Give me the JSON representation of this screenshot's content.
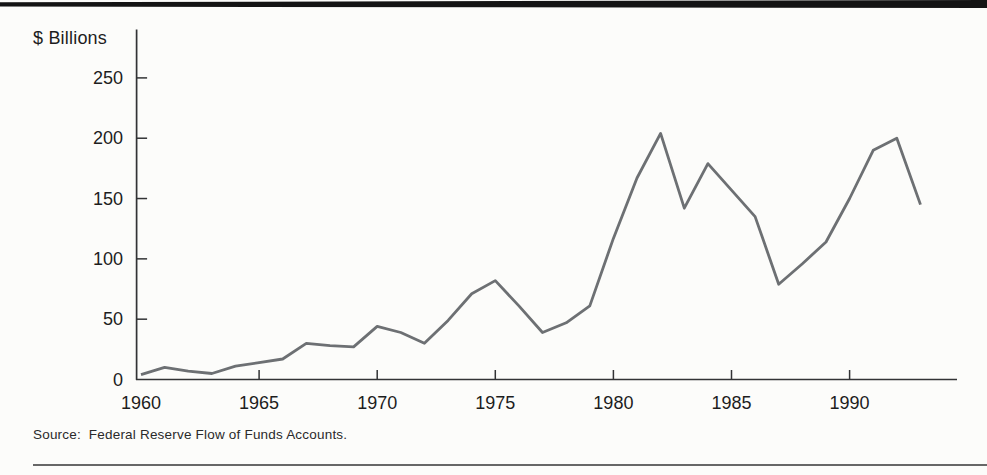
{
  "page": {
    "background_color": "#fcfcfa",
    "top_rule_color": "#141414",
    "bottom_rule_color": "#676767"
  },
  "chart": {
    "unit_label": "$ Billions",
    "source_note": "Source:  Federal Reserve Flow of Funds Accounts."
  },
  "chart_data": {
    "type": "line",
    "title": "",
    "ylabel": "$ Billions",
    "xlabel": "",
    "x": [
      1960,
      1961,
      1962,
      1963,
      1964,
      1965,
      1966,
      1967,
      1968,
      1969,
      1970,
      1971,
      1972,
      1973,
      1974,
      1975,
      1976,
      1977,
      1978,
      1979,
      1980,
      1981,
      1982,
      1983,
      1984,
      1985,
      1986,
      1987,
      1988,
      1989,
      1990,
      1991,
      1992,
      1993
    ],
    "values": [
      4,
      10,
      7,
      5,
      11,
      14,
      17,
      30,
      28,
      27,
      44,
      39,
      30,
      49,
      71,
      82,
      61,
      39,
      47,
      61,
      117,
      167,
      204,
      142,
      179,
      157,
      135,
      79,
      96,
      114,
      150,
      190,
      200,
      145
    ],
    "x_ticks": [
      1960,
      1965,
      1970,
      1975,
      1980,
      1985,
      1990
    ],
    "x_tick_marks": [
      1965,
      1970,
      1975,
      1980,
      1985,
      1990
    ],
    "y_ticks": [
      250,
      200,
      150,
      100,
      50,
      0
    ],
    "y_tick_marks": [
      250,
      200,
      150,
      100,
      50
    ],
    "xlim": [
      1960,
      1994.6
    ],
    "ylim": [
      0,
      290
    ],
    "grid": false,
    "legend": "none",
    "line_color": "#6d7073",
    "axis_color": "#323335",
    "text_color": "#1d1d1d",
    "source": "Source:  Federal Reserve Flow of Funds Accounts."
  }
}
